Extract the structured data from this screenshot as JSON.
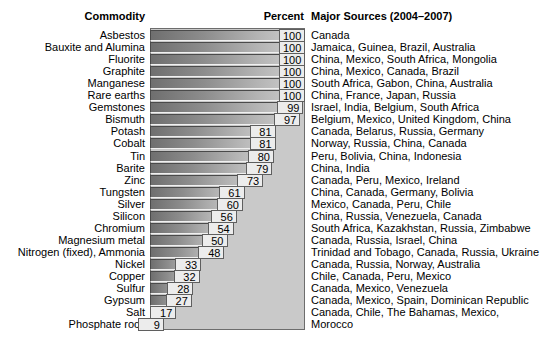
{
  "header": {
    "commodity": "Commodity",
    "percent": "Percent",
    "sources": "Major Sources (2004–2007)"
  },
  "colors": {
    "plot_background": "#c9c9c9",
    "plot_border": "#6d6d6d",
    "bar_dark": "#6f6f6f",
    "bar_light": "#d2d2d2",
    "value_box_fill": "#ececec",
    "text": "#000000",
    "page_background": "#ffffff"
  },
  "chart_data": {
    "type": "bar",
    "orientation": "horizontal",
    "title": "",
    "subtitle": "",
    "xlabel": "Percent",
    "ylabel": "Commodity",
    "xlim": [
      0,
      100
    ],
    "grid": false,
    "legend": false,
    "categories": [
      "Asbestos",
      "Bauxite and Alumina",
      "Fluorite",
      "Graphite",
      "Manganese",
      "Rare earths",
      "Gemstones",
      "Bismuth",
      "Potash",
      "Cobalt",
      "Tin",
      "Barite",
      "Zinc",
      "Tungsten",
      "Silver",
      "Silicon",
      "Chromium",
      "Magnesium metal",
      "Nitrogen (fixed), Ammonia",
      "Nickel",
      "Copper",
      "Sulfur",
      "Gypsum",
      "Salt",
      "Phosphate rock"
    ],
    "values": [
      100,
      100,
      100,
      100,
      100,
      100,
      99,
      97,
      81,
      81,
      80,
      79,
      73,
      61,
      60,
      56,
      54,
      50,
      48,
      33,
      32,
      28,
      27,
      17,
      9
    ],
    "annotations": [
      "Canada",
      "Jamaica, Guinea, Brazil, Australia",
      "China, Mexico, South Africa, Mongolia",
      "China, Mexico, Canada, Brazil",
      "South Africa, Gabon, China, Australia",
      "China, France, Japan, Russia",
      "Israel, India, Belgium, South Africa",
      "Belgium, Mexico, United Kingdom, China",
      "Canada, Belarus, Russia, Germany",
      "Norway, Russia, China, Canada",
      "Peru, Bolivia, China, Indonesia",
      "China, India",
      "Canada, Peru, Mexico, Ireland",
      "China, Canada, Germany, Bolivia",
      "Mexico, Canada, Peru, Chile",
      "China, Russia, Venezuela, Canada",
      "South Africa, Kazakhstan, Russia, Zimbabwe",
      "Canada, Russia, Israel, China",
      "Trinidad and Tobago, Canada, Russia, Ukraine",
      "Canada, Russia, Norway, Australia",
      "Chile, Canada, Peru, Mexico",
      "Canada, Mexico, Venezuela",
      "Canada, Mexico, Spain, Dominican Republic",
      "Canada, Chile, The Bahamas, Mexico,",
      "Morocco"
    ]
  },
  "rows": [
    {
      "commodity": "Asbestos",
      "percent": "100",
      "sources": "Canada"
    },
    {
      "commodity": "Bauxite and Alumina",
      "percent": "100",
      "sources": "Jamaica, Guinea, Brazil, Australia"
    },
    {
      "commodity": "Fluorite",
      "percent": "100",
      "sources": "China, Mexico, South Africa, Mongolia"
    },
    {
      "commodity": "Graphite",
      "percent": "100",
      "sources": "China, Mexico, Canada, Brazil"
    },
    {
      "commodity": "Manganese",
      "percent": "100",
      "sources": "South Africa, Gabon, China, Australia"
    },
    {
      "commodity": "Rare earths",
      "percent": "100",
      "sources": "China, France, Japan, Russia"
    },
    {
      "commodity": "Gemstones",
      "percent": "99",
      "sources": "Israel, India, Belgium, South Africa"
    },
    {
      "commodity": "Bismuth",
      "percent": "97",
      "sources": "Belgium, Mexico, United Kingdom, China"
    },
    {
      "commodity": "Potash",
      "percent": "81",
      "sources": "Canada, Belarus, Russia, Germany"
    },
    {
      "commodity": "Cobalt",
      "percent": "81",
      "sources": "Norway, Russia, China, Canada"
    },
    {
      "commodity": "Tin",
      "percent": "80",
      "sources": "Peru, Bolivia, China, Indonesia"
    },
    {
      "commodity": "Barite",
      "percent": "79",
      "sources": "China, India"
    },
    {
      "commodity": "Zinc",
      "percent": "73",
      "sources": "Canada, Peru, Mexico, Ireland"
    },
    {
      "commodity": "Tungsten",
      "percent": "61",
      "sources": "China, Canada, Germany, Bolivia"
    },
    {
      "commodity": "Silver",
      "percent": "60",
      "sources": "Mexico, Canada, Peru, Chile"
    },
    {
      "commodity": "Silicon",
      "percent": "56",
      "sources": "China, Russia, Venezuela, Canada"
    },
    {
      "commodity": "Chromium",
      "percent": "54",
      "sources": "South Africa, Kazakhstan, Russia, Zimbabwe"
    },
    {
      "commodity": "Magnesium metal",
      "percent": "50",
      "sources": "Canada, Russia, Israel, China"
    },
    {
      "commodity": "Nitrogen (fixed), Ammonia",
      "percent": "48",
      "sources": "Trinidad and Tobago, Canada, Russia, Ukraine"
    },
    {
      "commodity": "Nickel",
      "percent": "33",
      "sources": "Canada, Russia, Norway, Australia"
    },
    {
      "commodity": "Copper",
      "percent": "32",
      "sources": "Chile, Canada, Peru, Mexico"
    },
    {
      "commodity": "Sulfur",
      "percent": "28",
      "sources": "Canada, Mexico, Venezuela"
    },
    {
      "commodity": "Gypsum",
      "percent": "27",
      "sources": "Canada, Mexico, Spain, Dominican Republic"
    },
    {
      "commodity": "Salt",
      "percent": "17",
      "sources": "Canada, Chile, The Bahamas, Mexico,"
    },
    {
      "commodity": "Phosphate rock",
      "percent": "9",
      "sources": "Morocco"
    }
  ]
}
